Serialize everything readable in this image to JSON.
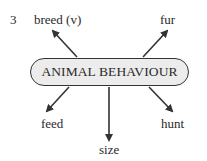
{
  "item_number": "3",
  "center": {
    "label": "ANIMAL BEHAVIOUR"
  },
  "nodes": [
    {
      "id": "breed",
      "label": "breed (v)"
    },
    {
      "id": "fur",
      "label": "fur"
    },
    {
      "id": "feed",
      "label": "feed"
    },
    {
      "id": "size",
      "label": "size"
    },
    {
      "id": "hunt",
      "label": "hunt"
    }
  ],
  "colors": {
    "arrow": "#333333",
    "center_fill": "#ececec",
    "text": "#2a2a2a"
  }
}
